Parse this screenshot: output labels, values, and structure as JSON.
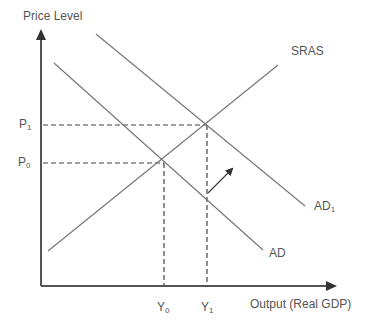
{
  "diagram": {
    "type": "AD-AS economics diagram",
    "axes": {
      "y_label": "Price Level",
      "x_label": "Output (Real GDP)"
    },
    "curves": [
      {
        "name": "SRAS",
        "label": "SRAS",
        "kind": "upward-sloping"
      },
      {
        "name": "AD",
        "label": "AD",
        "kind": "downward-sloping"
      },
      {
        "name": "AD1",
        "label": "AD",
        "subscript": "1",
        "kind": "downward-sloping"
      }
    ],
    "price_labels": [
      {
        "base": "P",
        "subscript": "1"
      },
      {
        "base": "P",
        "subscript": "0"
      }
    ],
    "output_labels": [
      {
        "base": "Y",
        "subscript": "0"
      },
      {
        "base": "Y",
        "subscript": "1"
      }
    ],
    "shift_arrow": "AD shifts right to AD1",
    "colors": {
      "line": "#777777",
      "axis": "#555555",
      "text": "#555555"
    }
  }
}
